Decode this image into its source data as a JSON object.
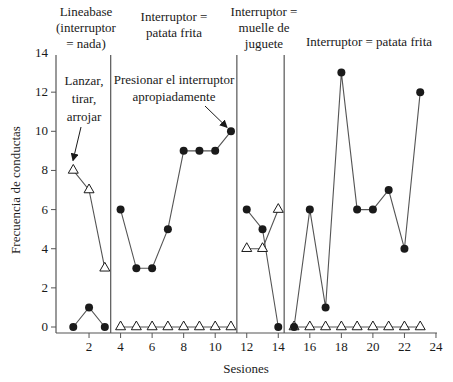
{
  "chart_data": {
    "type": "line",
    "title": "",
    "xlabel": "Sesiones",
    "ylabel": "Frecuencia de conductas",
    "xlim": [
      0,
      24
    ],
    "ylim": [
      0,
      14
    ],
    "x_ticks": [
      2,
      4,
      6,
      8,
      10,
      12,
      14,
      16,
      18,
      20,
      22,
      24
    ],
    "y_ticks": [
      0,
      2,
      4,
      6,
      8,
      10,
      12,
      14
    ],
    "grid": false,
    "legend": null,
    "phases": [
      {
        "label_lines": [
          "Lineabase",
          "(interruptor",
          "= nada)"
        ],
        "sessions": [
          1,
          3
        ],
        "divider_after": 3.5
      },
      {
        "label_lines": [
          "Interruptor =",
          "patata frita"
        ],
        "sessions": [
          4,
          11
        ],
        "divider_after": 11.5
      },
      {
        "label_lines": [
          "Interruptor =",
          "muelle de",
          "juguete"
        ],
        "sessions": [
          12,
          14
        ],
        "divider_after": 14.5
      },
      {
        "label_lines": [
          "Interruptor = patata frita"
        ],
        "sessions": [
          15,
          23
        ],
        "divider_after": null
      }
    ],
    "series": [
      {
        "name": "Presionar el interruptor apropiadamente",
        "marker": "filled-circle",
        "x": [
          1,
          2,
          3,
          4,
          5,
          6,
          7,
          8,
          9,
          10,
          11,
          12,
          13,
          14,
          15,
          16,
          17,
          18,
          19,
          20,
          21,
          22,
          23
        ],
        "values": [
          0,
          1,
          0,
          6,
          3,
          3,
          5,
          9,
          9,
          9,
          10,
          6,
          5,
          0,
          0,
          6,
          1,
          13,
          6,
          6,
          7,
          4,
          12
        ]
      },
      {
        "name": "Lanzar, tirar, arrojar",
        "marker": "open-triangle",
        "x": [
          1,
          2,
          3,
          4,
          5,
          6,
          7,
          8,
          9,
          10,
          11,
          12,
          13,
          14,
          15,
          16,
          17,
          18,
          19,
          20,
          21,
          22,
          23
        ],
        "values": [
          8,
          7,
          3,
          0,
          0,
          0,
          0,
          0,
          0,
          0,
          0,
          4,
          4,
          6,
          0,
          0,
          0,
          0,
          0,
          0,
          0,
          0,
          0
        ]
      }
    ],
    "annotations": [
      {
        "text_lines": [
          "Lanzar,",
          "tirar,",
          "arrojar"
        ],
        "points_to": {
          "series": "Lanzar, tirar, arrojar",
          "x": 1,
          "y": 8
        }
      },
      {
        "text_lines": [
          "Presionar el interruptor",
          "apropiadamente"
        ],
        "points_to": {
          "series": "Presionar el interruptor apropiadamente",
          "x": 11,
          "y": 10
        }
      }
    ]
  },
  "labels": {
    "xlabel": "Sesiones",
    "ylabel": "Frecuencia de conductas",
    "phase1": [
      "Lineabase",
      "(interruptor",
      "= nada)"
    ],
    "phase2": [
      "Interruptor =",
      "patata frita"
    ],
    "phase3": [
      "Interruptor =",
      "muelle de",
      "juguete"
    ],
    "phase4": [
      "Interruptor = patata frita"
    ],
    "annot_throw": [
      "Lanzar,",
      "tirar,",
      "arrojar"
    ],
    "annot_press": [
      "Presionar el interruptor",
      "apropiadamente"
    ]
  },
  "colors": {
    "ink": "#1a1a1a",
    "line": "#555555",
    "background": "#ffffff"
  }
}
